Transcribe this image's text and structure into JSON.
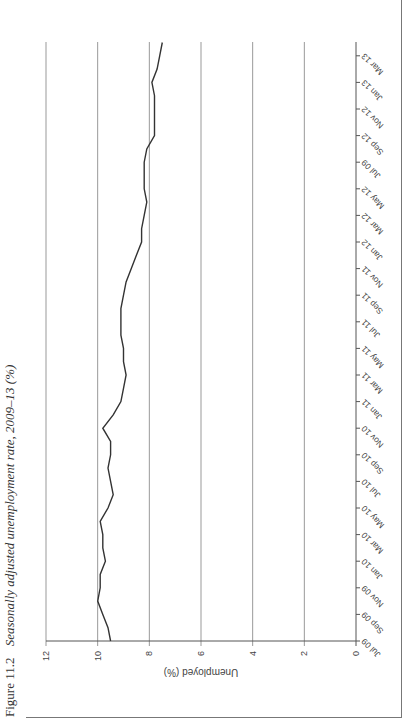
{
  "figure": {
    "number": "Figure 11.2",
    "title": "Seasonally adjusted unemployment rate, 2009–13 (%)"
  },
  "chart_data": {
    "type": "line",
    "title": "Seasonally adjusted unemployment rate, 2009–13 (%)",
    "xlabel": "",
    "ylabel": "Unemployed (%)",
    "ylim": [
      0,
      12
    ],
    "yticks": [
      0,
      2,
      4,
      6,
      8,
      10,
      12
    ],
    "grid": true,
    "legend": null,
    "orientation_note": "Figure printed rotated 90° counter-clockwise on page",
    "tick_labels": [
      "Jul 09",
      "Sep 09",
      "Nov 09",
      "Jan 10",
      "Mar 10",
      "May 10",
      "Jul 10",
      "Sep 10",
      "Nov 10",
      "Jan 11",
      "Mar 11",
      "May 11",
      "Jul 11",
      "Sep 11",
      "Nov 11",
      "Jan 12",
      "Mar 12",
      "May 12",
      "Jul 09",
      "Sep 12",
      "Nov 12",
      "Jan 13",
      "Mar 13"
    ],
    "x": [
      "Jul 09",
      "Aug 09",
      "Sep 09",
      "Oct 09",
      "Nov 09",
      "Dec 09",
      "Jan 10",
      "Feb 10",
      "Mar 10",
      "Apr 10",
      "May 10",
      "Jun 10",
      "Jul 10",
      "Aug 10",
      "Sep 10",
      "Oct 10",
      "Nov 10",
      "Dec 10",
      "Jan 11",
      "Feb 11",
      "Mar 11",
      "Apr 11",
      "May 11",
      "Jun 11",
      "Jul 11",
      "Aug 11",
      "Sep 11",
      "Oct 11",
      "Nov 11",
      "Dec 11",
      "Jan 12",
      "Feb 12",
      "Mar 12",
      "Apr 12",
      "May 12",
      "Jun 12",
      "Jul 12",
      "Aug 12",
      "Sep 12",
      "Oct 12",
      "Nov 12",
      "Dec 12",
      "Jan 13",
      "Feb 13",
      "Mar 13",
      "Apr 13"
    ],
    "series": [
      {
        "name": "Unemployment rate (%)",
        "color": "#333333",
        "values": [
          9.5,
          9.6,
          9.8,
          10.0,
          9.9,
          9.9,
          9.7,
          9.8,
          9.8,
          9.9,
          9.6,
          9.4,
          9.5,
          9.6,
          9.5,
          9.5,
          9.8,
          9.4,
          9.1,
          9.0,
          8.9,
          9.0,
          9.0,
          9.1,
          9.1,
          9.1,
          9.0,
          8.9,
          8.7,
          8.5,
          8.3,
          8.3,
          8.2,
          8.1,
          8.2,
          8.2,
          8.2,
          8.1,
          7.8,
          7.8,
          7.8,
          7.8,
          7.9,
          7.7,
          7.6,
          7.5
        ]
      }
    ]
  }
}
